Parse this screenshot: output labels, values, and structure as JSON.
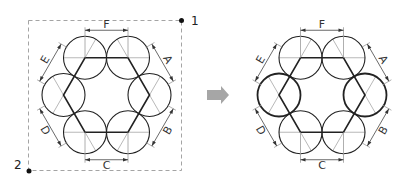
{
  "figure": {
    "left_diagram": {
      "dimension_labels": [
        "A",
        "B",
        "C",
        "D",
        "E",
        "F"
      ],
      "corner_points": [
        "1",
        "2"
      ],
      "bounding_box": "dashed",
      "circle_stroke": "thin"
    },
    "arrow": {
      "direction": "right",
      "color": "#a6a6a6"
    },
    "right_diagram": {
      "dimension_labels": [
        "A",
        "B",
        "C",
        "D",
        "E",
        "F"
      ],
      "circle_stroke": "thick on left and right circles"
    }
  },
  "colors": {
    "line": "#222222",
    "dim_line": "#9a9a9a",
    "dash": "#9a9a9a",
    "arrow": "#a6a6a6"
  }
}
